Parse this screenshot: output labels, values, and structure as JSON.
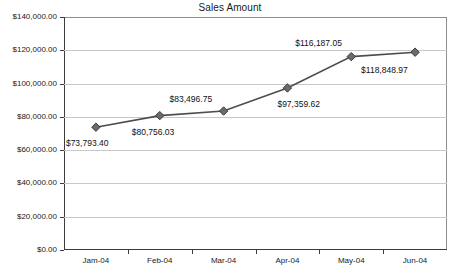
{
  "chart_data": {
    "type": "line",
    "title": "Sales Amount",
    "xlabel": "",
    "ylabel": "",
    "categories": [
      "Jam-04",
      "Feb-04",
      "Mar-04",
      "Apr-04",
      "May-04",
      "Jun-04"
    ],
    "values": [
      73793.4,
      80756.03,
      83496.75,
      97359.62,
      116187.05,
      118848.97
    ],
    "point_labels": [
      "$73,793.40",
      "$80,756.03",
      "$83,496.75",
      "$97,359.62",
      "$116,187.05",
      "$118,848.97"
    ],
    "ylim": [
      0,
      140000
    ],
    "ytick_values": [
      0,
      20000,
      40000,
      60000,
      80000,
      100000,
      120000,
      140000
    ],
    "ytick_labels": [
      "$0.00",
      "$20,000.00",
      "$40,000.00",
      "$60,000.00",
      "$80,000.00",
      "$100,000.00",
      "$120,000.00",
      "$140,000.00"
    ],
    "grid": true,
    "legend": "none",
    "series_color": "#4d4d4d",
    "marker": "diamond",
    "marker_color": "#6b6b6b",
    "gridline_color": "#c8c8c8",
    "axis_color": "#3c3c3c"
  },
  "footer": {
    "note": ""
  }
}
